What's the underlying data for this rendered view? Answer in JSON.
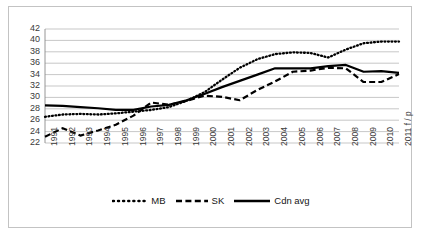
{
  "chart_data": {
    "type": "line",
    "title": "",
    "subtitle": "",
    "xlabel": "",
    "ylabel": "",
    "grid": true,
    "legend_position": "bottom",
    "ylim": [
      22,
      42
    ],
    "ytick_step": 2,
    "ytick_labels": [
      "42",
      "40",
      "38",
      "36",
      "34",
      "32",
      "30",
      "28",
      "26",
      "24",
      "22"
    ],
    "categories": [
      "1991",
      "1992",
      "1993",
      "1994",
      "1995",
      "1996",
      "1997",
      "1998",
      "1999",
      "2000",
      "2001",
      "2002",
      "2003",
      "2004",
      "2005",
      "2006",
      "2007",
      "2008",
      "2009",
      "2010",
      "2011 f / p"
    ],
    "series": [
      {
        "name": "MB",
        "style": "dotted",
        "color": "#000000",
        "values": [
          26.6,
          27.0,
          27.1,
          27.0,
          27.2,
          27.5,
          27.8,
          28.3,
          29.4,
          30.9,
          33.1,
          35.2,
          36.7,
          37.6,
          37.9,
          37.8,
          37.0,
          38.4,
          39.5,
          39.8,
          39.8
        ]
      },
      {
        "name": "SK",
        "style": "dashed",
        "color": "#000000",
        "values": [
          23.1,
          24.6,
          23.3,
          24.2,
          25.2,
          26.8,
          29.1,
          28.7,
          29.4,
          30.3,
          30.1,
          29.5,
          31.3,
          32.8,
          34.5,
          34.7,
          35.2,
          35.1,
          32.7,
          32.7,
          34.1
        ]
      },
      {
        "name": "Cdn avg",
        "style": "solid",
        "color": "#000000",
        "values": [
          28.6,
          28.5,
          28.3,
          28.1,
          27.8,
          27.8,
          28.4,
          28.7,
          29.5,
          30.6,
          31.8,
          32.9,
          34.0,
          35.1,
          35.1,
          35.1,
          35.5,
          35.7,
          34.5,
          34.6,
          34.3
        ]
      }
    ]
  },
  "legend": {
    "items": [
      {
        "label": "MB"
      },
      {
        "label": "SK"
      },
      {
        "label": "Cdn avg"
      }
    ]
  }
}
